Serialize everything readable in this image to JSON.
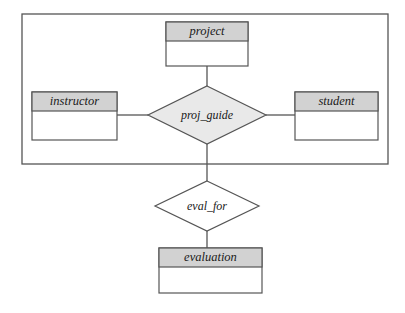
{
  "diagram": {
    "type": "er-diagram",
    "title": "",
    "colors": {
      "entity_header_fill": "#d2d2d2",
      "entity_body_fill": "#ffffff",
      "relationship_fill_shaded": "#e9e9e9",
      "relationship_fill_plain": "#ffffff",
      "stroke": "#555555",
      "text": "#1a1a1a",
      "background": "#ffffff"
    },
    "entities": [
      {
        "id": "project",
        "label": "project",
        "x": 166,
        "y": 22,
        "width": 82,
        "height": 44,
        "header_height": 19,
        "shaded_header": true
      },
      {
        "id": "instructor",
        "label": "instructor",
        "x": 32,
        "y": 92,
        "width": 85,
        "height": 48,
        "header_height": 19,
        "shaded_header": true
      },
      {
        "id": "student",
        "label": "student",
        "x": 295,
        "y": 92,
        "width": 83,
        "height": 48,
        "header_height": 19,
        "shaded_header": true
      },
      {
        "id": "evaluation",
        "label": "evaluation",
        "x": 159,
        "y": 248,
        "width": 103,
        "height": 45,
        "header_height": 19,
        "shaded_header": true
      }
    ],
    "relationships": [
      {
        "id": "proj_guide",
        "label": "proj_guide",
        "cx": 207,
        "cy": 115,
        "rx": 59,
        "ry": 29,
        "shaded": true
      },
      {
        "id": "eval_for",
        "label": "eval_for",
        "cx": 207,
        "cy": 206,
        "rx": 52,
        "ry": 25,
        "shaded": false
      }
    ],
    "connectors": [
      {
        "id": "project-to-proj_guide",
        "from": "project",
        "to": "proj_guide",
        "x1": 207,
        "y1": 66,
        "x2": 207,
        "y2": 86
      },
      {
        "id": "instructor-to-proj_guide",
        "from": "instructor",
        "to": "proj_guide",
        "x1": 117,
        "y1": 115,
        "x2": 148,
        "y2": 115
      },
      {
        "id": "student-to-proj_guide",
        "from": "student",
        "to": "proj_guide",
        "x1": 266,
        "y1": 115,
        "x2": 295,
        "y2": 115
      },
      {
        "id": "proj_guide-to-eval_for",
        "from": "proj_guide",
        "to": "eval_for",
        "x1": 207,
        "y1": 144,
        "x2": 207,
        "y2": 181
      },
      {
        "id": "eval_for-to-evaluation",
        "from": "eval_for",
        "to": "evaluation",
        "x1": 207,
        "y1": 231,
        "x2": 207,
        "y2": 248
      }
    ],
    "aggregation_box": {
      "id": "aggregation-boundary",
      "label": "",
      "x": 22,
      "y": 14,
      "width": 366,
      "height": 150
    }
  }
}
